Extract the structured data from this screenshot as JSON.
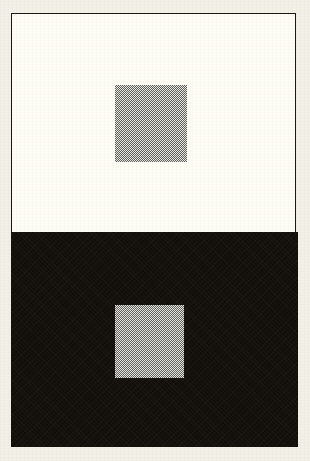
{
  "figure": {
    "type": "simultaneous-contrast-illusion",
    "page_background": "#f2f0e7",
    "plate": {
      "frame_color": "#1a1714",
      "frame_width_px": 1.5,
      "x": 11,
      "y": 13,
      "width": 285,
      "height": 434
    },
    "panels": [
      {
        "id": "upper",
        "role": "light-surround",
        "fill": "#fdfcf5",
        "x": 0,
        "y": 0,
        "width": 285,
        "height": 220
      },
      {
        "id": "lower",
        "role": "dark-surround",
        "fill": "#120e0a",
        "x": 0,
        "y": 219,
        "width": 287,
        "height": 215
      }
    ],
    "patches": [
      {
        "id": "patch-on-light",
        "label": "grey test square on light surround",
        "fill": "#b9b9b4",
        "texture": "halftone-checker-dither",
        "x": 103,
        "y": 71,
        "width": 72,
        "height": 77
      },
      {
        "id": "patch-on-dark",
        "label": "grey test square on dark surround",
        "fill": "#b9b9b4",
        "texture": "halftone-checker-dither",
        "x": 104,
        "y": 292,
        "width": 69,
        "height": 73
      }
    ],
    "note": "Both grey squares are printed at the same ink density; only the surrounding field differs."
  }
}
